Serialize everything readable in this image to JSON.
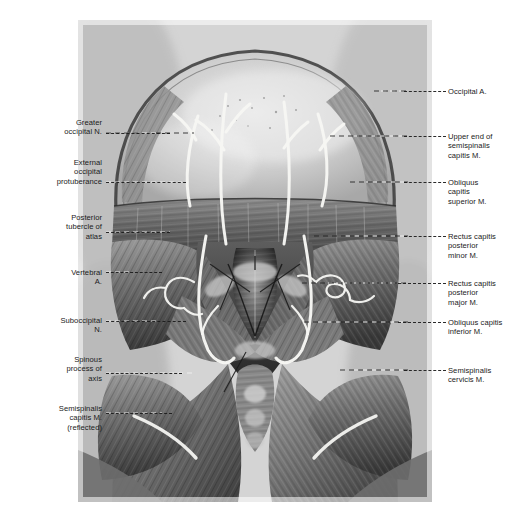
{
  "plate": {
    "title": "Suboccipital region, posterior view",
    "caption": "",
    "background_color": "#ffffff",
    "illustration_tone": "#d9d9d9",
    "leader_color": "#1b1b1b",
    "leader_highlight_color": "#f3f3f3",
    "vessel_color": "#f7f7f4"
  },
  "labels_left": [
    {
      "id": "greater-occipital-nerve",
      "text": "Greater\noccipital N.",
      "x": 30,
      "y": 118,
      "width": 72,
      "leader_x": 106,
      "leader_y": 133,
      "leader_w": 64
    },
    {
      "id": "external-occipital-protuberance",
      "text": "External\noccipital\nprotuberance",
      "x": 22,
      "y": 158,
      "width": 80,
      "leader_x": 106,
      "leader_y": 182,
      "leader_w": 80
    },
    {
      "id": "posterior-tubercle-of-atlas",
      "text": "Posterior\ntubercle of\natlas",
      "x": 28,
      "y": 213,
      "width": 74,
      "leader_x": 106,
      "leader_y": 232,
      "leader_w": 64
    },
    {
      "id": "vertebral-artery",
      "text": "Vertebral\nA.",
      "x": 34,
      "y": 268,
      "width": 68,
      "leader_x": 106,
      "leader_y": 272,
      "leader_w": 56
    },
    {
      "id": "suboccipital-nerve",
      "text": "Suboccipital\nN.",
      "x": 22,
      "y": 316,
      "width": 80,
      "leader_x": 106,
      "leader_y": 321,
      "leader_w": 80
    },
    {
      "id": "spinous-process-of-axis",
      "text": "Spinous\nprocess of\naxis",
      "x": 28,
      "y": 355,
      "width": 74,
      "leader_x": 106,
      "leader_y": 373,
      "leader_w": 76
    },
    {
      "id": "semispinalis-capitis-reflected",
      "text": "Semispinalis\ncapitis M.\n(reflected)",
      "x": 18,
      "y": 404,
      "width": 84,
      "leader_x": 106,
      "leader_y": 413,
      "leader_w": 66
    }
  ],
  "labels_right": [
    {
      "id": "occipital-artery",
      "text": "Occipital A.",
      "x": 448,
      "y": 87,
      "width": 82,
      "leader_x": 404,
      "leader_y": 91,
      "leader_w": 42
    },
    {
      "id": "upper-end-semispinalis-capitis",
      "text": "Upper end of\nsemispinalis\ncapitis M.",
      "x": 448,
      "y": 132,
      "width": 82,
      "leader_x": 404,
      "leader_y": 136,
      "leader_w": 42
    },
    {
      "id": "obliquus-capitis-superior",
      "text": "Obliquus\ncapitis\nsuperior M.",
      "x": 448,
      "y": 178,
      "width": 82,
      "leader_x": 404,
      "leader_y": 182,
      "leader_w": 42
    },
    {
      "id": "rectus-capitis-posterior-minor",
      "text": "Rectus capitis\nposterior\nminor M.",
      "x": 448,
      "y": 232,
      "width": 82,
      "leader_x": 404,
      "leader_y": 236,
      "leader_w": 42
    },
    {
      "id": "rectus-capitis-posterior-major",
      "text": "Rectus capitis\nposterior\nmajor M.",
      "x": 448,
      "y": 279,
      "width": 82,
      "leader_x": 398,
      "leader_y": 283,
      "leader_w": 48
    },
    {
      "id": "obliquus-capitis-inferior",
      "text": "Obliquus capitis\ninferior M.",
      "x": 448,
      "y": 318,
      "width": 82,
      "leader_x": 398,
      "leader_y": 322,
      "leader_w": 48
    },
    {
      "id": "semispinalis-cervicis",
      "text": "Semispinalis\ncervicis M.",
      "x": 448,
      "y": 366,
      "width": 82,
      "leader_x": 404,
      "leader_y": 370,
      "leader_w": 42
    }
  ],
  "illustration": {
    "description": "Grayscale anatomical dissection drawing of the posterior neck showing the suboccipital triangle with reflected semispinalis capitis muscles, vertebral artery, greater occipital and suboccipital nerves.",
    "frame": {
      "x": 78,
      "y": 20,
      "w": 354,
      "h": 482
    }
  }
}
